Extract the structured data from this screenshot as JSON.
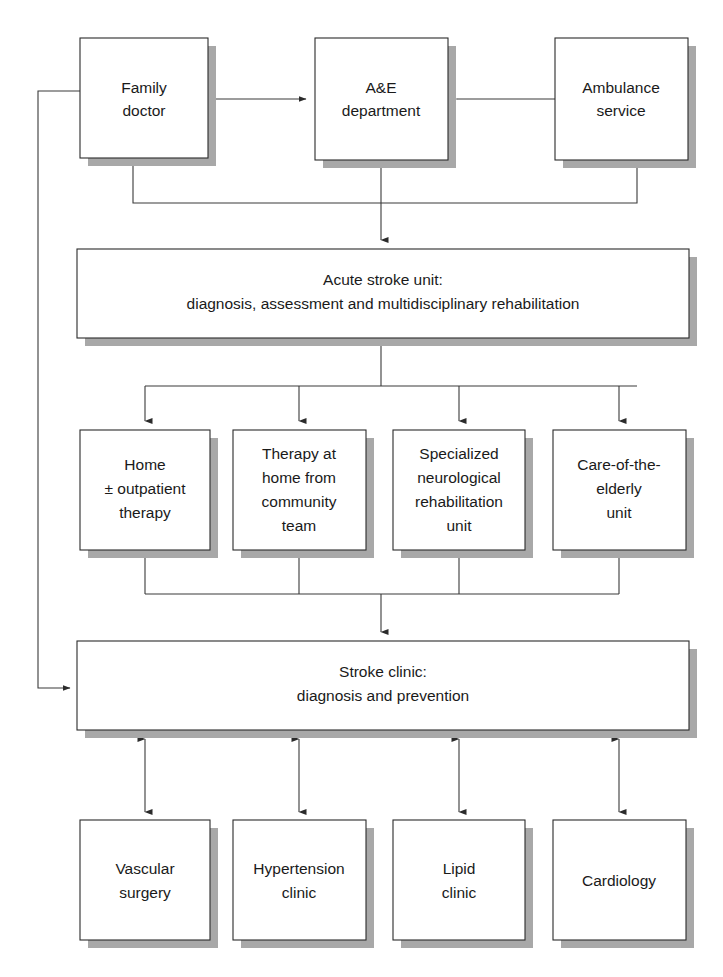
{
  "figure": {
    "kind": "flowchart",
    "background_color": "#ffffff",
    "box_fill": "#ffffff",
    "box_stroke": "#2b2b2b",
    "shadow_color": "#a8a8a8",
    "line_color": "#3a3a3a",
    "text_color": "#1a1a1a"
  },
  "nodes": {
    "family_doctor": {
      "id": "family-doctor",
      "lines": [
        "Family",
        "doctor"
      ],
      "x": 80,
      "y": 38,
      "w": 128,
      "h": 120
    },
    "ae_department": {
      "id": "ae-department",
      "lines": [
        "A&E",
        "department"
      ],
      "x": 315,
      "y": 38,
      "w": 133,
      "h": 122
    },
    "ambulance_service": {
      "id": "ambulance-service",
      "lines": [
        "Ambulance",
        "service"
      ],
      "x": 555,
      "y": 38,
      "w": 133,
      "h": 122
    },
    "acute_stroke_unit": {
      "id": "acute-stroke-unit",
      "lines": [
        "Acute stroke unit:",
        "diagnosis, assessment and multidisciplinary rehabilitation"
      ],
      "x": 77,
      "y": 249,
      "w": 612,
      "h": 89
    },
    "home_outpatient": {
      "id": "home-outpatient-therapy",
      "lines": [
        "Home",
        "± outpatient",
        "therapy"
      ],
      "x": 80,
      "y": 430,
      "w": 130,
      "h": 120
    },
    "therapy_community": {
      "id": "therapy-at-home-community-team",
      "lines": [
        "Therapy at",
        "home from",
        "community",
        "team"
      ],
      "x": 233,
      "y": 430,
      "w": 133,
      "h": 120
    },
    "neuro_rehab": {
      "id": "specialized-neurological-rehabilitation-unit",
      "lines": [
        "Specialized",
        "neurological",
        "rehabilitation",
        "unit"
      ],
      "x": 393,
      "y": 430,
      "w": 132,
      "h": 120
    },
    "care_elderly": {
      "id": "care-of-the-elderly-unit",
      "lines": [
        "Care-of-the-",
        "elderly",
        "unit"
      ],
      "x": 553,
      "y": 430,
      "w": 133,
      "h": 120
    },
    "stroke_clinic": {
      "id": "stroke-clinic",
      "lines": [
        "Stroke clinic:",
        "diagnosis and prevention"
      ],
      "x": 77,
      "y": 641,
      "w": 612,
      "h": 89
    },
    "vascular_surgery": {
      "id": "vascular-surgery",
      "lines": [
        "Vascular",
        "surgery"
      ],
      "x": 80,
      "y": 820,
      "w": 130,
      "h": 120
    },
    "hypertension_clinic": {
      "id": "hypertension-clinic",
      "lines": [
        "Hypertension",
        "clinic"
      ],
      "x": 233,
      "y": 820,
      "w": 133,
      "h": 120
    },
    "lipid_clinic": {
      "id": "lipid-clinic",
      "lines": [
        "Lipid",
        "clinic"
      ],
      "x": 393,
      "y": 820,
      "w": 132,
      "h": 120
    },
    "cardiology": {
      "id": "cardiology",
      "lines": [
        "Cardiology"
      ],
      "x": 553,
      "y": 820,
      "w": 133,
      "h": 120
    }
  },
  "edges": [
    {
      "id": "family-doctor-to-ae",
      "from": "family_doctor",
      "to": "ae_department",
      "style": "arrow-right"
    },
    {
      "id": "ambulance-to-ae",
      "from": "ambulance_service",
      "to": "ae_department",
      "style": "arrow-left"
    },
    {
      "id": "family-doctor-to-acute-stroke-unit",
      "from": "family_doctor",
      "to": "acute_stroke_unit",
      "style": "elbow-merge-down"
    },
    {
      "id": "ambulance-to-acute-stroke-unit",
      "from": "ambulance_service",
      "to": "acute_stroke_unit",
      "style": "elbow-merge-down"
    },
    {
      "id": "ae-to-acute-stroke-unit",
      "from": "ae_department",
      "to": "acute_stroke_unit",
      "style": "arrow-down"
    },
    {
      "id": "acute-stroke-unit-to-home",
      "from": "acute_stroke_unit",
      "to": "home_outpatient",
      "style": "bus-down-arrow"
    },
    {
      "id": "acute-stroke-unit-to-therapy-community",
      "from": "acute_stroke_unit",
      "to": "therapy_community",
      "style": "bus-down-arrow"
    },
    {
      "id": "acute-stroke-unit-to-neuro-rehab",
      "from": "acute_stroke_unit",
      "to": "neuro_rehab",
      "style": "bus-down-arrow"
    },
    {
      "id": "acute-stroke-unit-to-care-elderly",
      "from": "acute_stroke_unit",
      "to": "care_elderly",
      "style": "bus-down-arrow"
    },
    {
      "id": "home-to-stroke-clinic",
      "from": "home_outpatient",
      "to": "stroke_clinic",
      "style": "bus-merge-down"
    },
    {
      "id": "therapy-community-to-stroke-clinic",
      "from": "therapy_community",
      "to": "stroke_clinic",
      "style": "bus-merge-down"
    },
    {
      "id": "neuro-rehab-to-stroke-clinic",
      "from": "neuro_rehab",
      "to": "stroke_clinic",
      "style": "bus-merge-down"
    },
    {
      "id": "care-elderly-to-stroke-clinic",
      "from": "care_elderly",
      "to": "stroke_clinic",
      "style": "bus-merge-down"
    },
    {
      "id": "family-doctor-to-stroke-clinic",
      "from": "family_doctor",
      "to": "stroke_clinic",
      "style": "left-feedback-arrow"
    },
    {
      "id": "stroke-clinic-vascular-surgery",
      "from": "stroke_clinic",
      "to": "vascular_surgery",
      "style": "double-arrow-vertical"
    },
    {
      "id": "stroke-clinic-hypertension-clinic",
      "from": "stroke_clinic",
      "to": "hypertension_clinic",
      "style": "double-arrow-vertical"
    },
    {
      "id": "stroke-clinic-lipid-clinic",
      "from": "stroke_clinic",
      "to": "lipid_clinic",
      "style": "double-arrow-vertical"
    },
    {
      "id": "stroke-clinic-cardiology",
      "from": "stroke_clinic",
      "to": "cardiology",
      "style": "double-arrow-vertical"
    }
  ]
}
